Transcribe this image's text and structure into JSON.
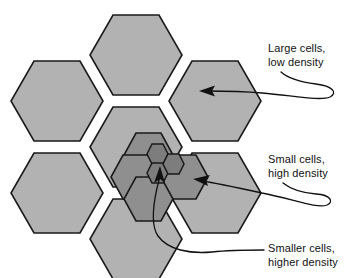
{
  "figure": {
    "name": "cellular-network-cell-hierarchy",
    "background_color": "#ffffff",
    "stroke_color": "#1a1a1a"
  },
  "palette": {
    "large_cell_fill": "#b2b2b2",
    "medium_cell_fill": "#8f8f8f",
    "small_cell_fill": "#7d7d7d",
    "outline": "#1a1a1a",
    "text": "#111111"
  },
  "annotations": [
    {
      "id": "large",
      "line1": "Large cells,",
      "line2": "low density",
      "target": "large-hexagon-upper-right",
      "arrow_tip": {
        "x": 203,
        "y": 91
      }
    },
    {
      "id": "small",
      "line1": "Small cells,",
      "line2": "high density",
      "target": "medium-hexagon-right",
      "arrow_tip": {
        "x": 196,
        "y": 180
      }
    },
    {
      "id": "smaller",
      "line1": "Smaller cells,",
      "line2": "higher density",
      "target": "small-hexagon-cluster-center",
      "arrow_tip": {
        "x": 160,
        "y": 168
      }
    }
  ],
  "cells": {
    "large": {
      "label": "Large cells, low density",
      "count": 7,
      "radius": 46,
      "fill": "#b2b2b2",
      "centers": [
        {
          "name": "large-cell-top",
          "x": 136,
          "y": 55
        },
        {
          "name": "large-cell-upper-left",
          "x": 57,
          "y": 101
        },
        {
          "name": "large-cell-upper-right",
          "x": 215,
          "y": 101
        },
        {
          "name": "large-cell-center",
          "x": 136,
          "y": 147
        },
        {
          "name": "large-cell-lower-left",
          "x": 57,
          "y": 193
        },
        {
          "name": "large-cell-lower-right",
          "x": 215,
          "y": 193
        },
        {
          "name": "large-cell-bottom",
          "x": 136,
          "y": 239
        }
      ]
    },
    "medium": {
      "label": "Small cells, high density",
      "count": 4,
      "radius": 25,
      "fill": "#8f8f8f",
      "centers": [
        {
          "name": "medium-cell-top",
          "x": 148,
          "y": 155
        },
        {
          "name": "medium-cell-left",
          "x": 135,
          "y": 177
        },
        {
          "name": "medium-cell-right",
          "x": 183,
          "y": 177
        },
        {
          "name": "medium-cell-bottom",
          "x": 148,
          "y": 199
        }
      ]
    },
    "small": {
      "label": "Smaller cells, higher density",
      "count": 3,
      "radius": 11,
      "fill": "#7d7d7d",
      "centers": [
        {
          "name": "small-cell-upper",
          "x": 157,
          "y": 154
        },
        {
          "name": "small-cell-lower",
          "x": 157,
          "y": 173
        },
        {
          "name": "small-cell-right",
          "x": 173,
          "y": 164
        }
      ]
    }
  }
}
